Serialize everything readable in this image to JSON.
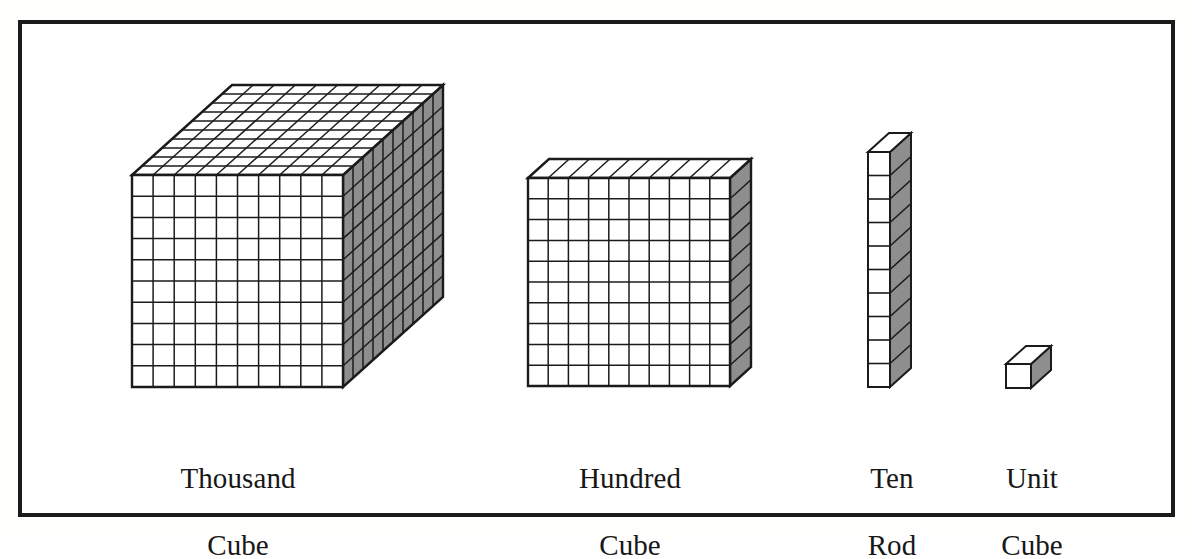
{
  "figure": {
    "frame": {
      "border_color": "#1b1b1b",
      "border_width": 4,
      "background": "#ffffff"
    },
    "palette": {
      "line": "#1b1b1b",
      "face_front": "#ffffff",
      "face_top": "#ffffff",
      "face_side": "#8e8e8e",
      "text": "#171717"
    }
  },
  "blocks": [
    {
      "id": "thousand-cube",
      "label_line1": "Thousand",
      "label_line2": "Cube",
      "shape": "cube",
      "value": 1000,
      "grid_cols": 10,
      "grid_rows": 10,
      "grid_depth": 10,
      "front": {
        "x": 132,
        "y": 175,
        "w": 211,
        "h": 212
      },
      "depth": {
        "dx": 100,
        "dy": -90
      }
    },
    {
      "id": "hundred-flat",
      "label_line1": "Hundred",
      "label_line2": "Cube",
      "shape": "flat",
      "value": 100,
      "grid_cols": 10,
      "grid_rows": 10,
      "grid_depth": 1,
      "front": {
        "x": 528,
        "y": 178,
        "w": 202,
        "h": 208
      },
      "depth": {
        "dx": 21,
        "dy": -19
      }
    },
    {
      "id": "ten-rod",
      "label_line1": "Ten",
      "label_line2": "Rod",
      "shape": "rod",
      "value": 10,
      "grid_cols": 1,
      "grid_rows": 10,
      "grid_depth": 1,
      "front": {
        "x": 868,
        "y": 152,
        "w": 22,
        "h": 235
      },
      "depth": {
        "dx": 21,
        "dy": -19
      }
    },
    {
      "id": "unit-cube",
      "label_line1": "Unit",
      "label_line2": "Cube",
      "shape": "unit",
      "value": 1,
      "grid_cols": 1,
      "grid_rows": 1,
      "grid_depth": 1,
      "front": {
        "x": 1006,
        "y": 364,
        "w": 25,
        "h": 24
      },
      "depth": {
        "dx": 20,
        "dy": -18
      }
    }
  ],
  "ghost_artifacts": [
    {
      "text": "Tab. 00.",
      "x": 470,
      "y": 96
    },
    {
      "text": "DO 00",
      "x": 845,
      "y": 92
    },
    {
      "text": "to to the and",
      "x": 60,
      "y": 222
    },
    {
      "text": "Unit",
      "x": 770,
      "y": 218
    }
  ]
}
